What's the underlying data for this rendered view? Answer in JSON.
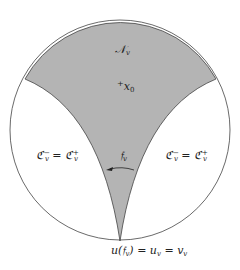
{
  "diagram": {
    "type": "disk-region-diagram",
    "colors": {
      "background": "#ffffff",
      "shaded_region": "#b4b4b4",
      "stroke": "#444444"
    },
    "labels": {
      "region_top": {
        "main": "𝒩",
        "sub": "v"
      },
      "point": {
        "marker": "+",
        "main": "x",
        "sub": "0"
      },
      "left_region": {
        "a": "ℭ",
        "a_sup": "−",
        "a_sub": "v",
        "eq": " = ",
        "b": "ℭ",
        "b_sup": "+",
        "b_sub": "v"
      },
      "right_region": {
        "a": "ℭ",
        "a_sup": "−",
        "a_sub": "v",
        "eq": " = ",
        "b": "ℭ",
        "b_sup": "+",
        "b_sub": "v"
      },
      "arrow": {
        "main": "𝔣",
        "sub": "v"
      },
      "bottom": {
        "text1": "u(𝔣",
        "sub1": "v",
        "text2": ") = u",
        "sub2": "v",
        "text3": " = v",
        "sub3": "v"
      }
    }
  }
}
